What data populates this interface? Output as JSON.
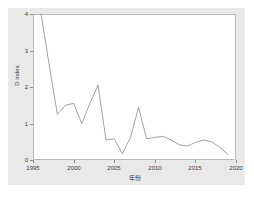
{
  "chart_data": {
    "type": "line",
    "title": "",
    "xlabel": "年份",
    "ylabel": "D index",
    "xlim": [
      1995,
      2020
    ],
    "ylim": [
      0,
      4
    ],
    "grid": false,
    "legend": "none",
    "xticks": [
      "1995",
      "2000",
      "2005",
      "2010",
      "2015",
      "2020"
    ],
    "xtick_values": [
      1995,
      2000,
      2005,
      2010,
      2015,
      2020
    ],
    "yticks": [
      "0",
      "1",
      "2",
      "3",
      "4"
    ],
    "ytick_values": [
      0,
      1,
      2,
      3,
      4
    ],
    "line_color": "#7b7b7b",
    "series": [
      {
        "name": "D index",
        "x": [
          1996,
          1997,
          1998,
          1999,
          2000,
          2001,
          2002,
          2003,
          2004,
          2005,
          2006,
          2007,
          2008,
          2009,
          2010,
          2011,
          2012,
          2013,
          2014,
          2015,
          2016,
          2017,
          2018,
          2019
        ],
        "values": [
          4.0,
          2.6,
          1.25,
          1.5,
          1.55,
          1.0,
          1.55,
          2.05,
          0.55,
          0.58,
          0.17,
          0.62,
          1.44,
          0.58,
          0.62,
          0.65,
          0.55,
          0.42,
          0.38,
          0.48,
          0.55,
          0.5,
          0.35,
          0.15
        ]
      }
    ]
  },
  "axes": {
    "y_title": "D index",
    "x_title": "年份"
  }
}
